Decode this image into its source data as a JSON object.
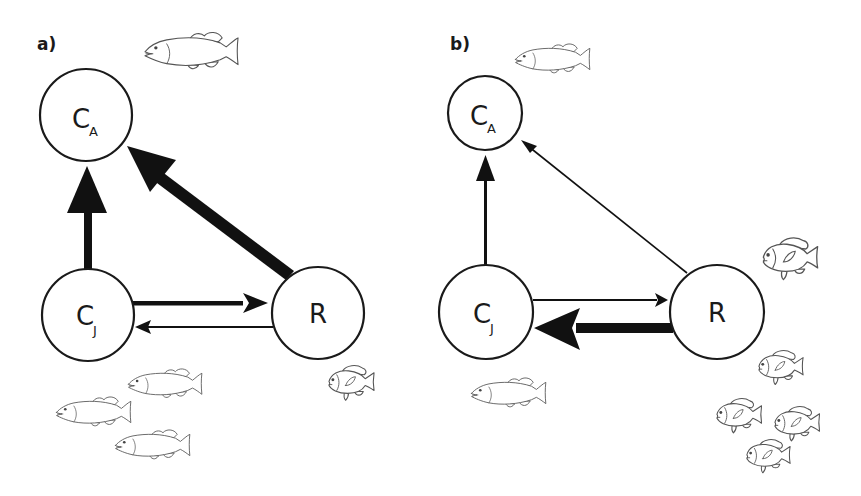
{
  "panels": [
    {
      "label": "a)",
      "nodes": [
        {
          "id": "CA",
          "main": "C",
          "sub": "A"
        },
        {
          "id": "CJ",
          "main": "C",
          "sub": "J"
        },
        {
          "id": "R",
          "main": "R",
          "sub": ""
        }
      ],
      "edges": [
        {
          "from": "CJ",
          "to": "CA",
          "weight": "thick"
        },
        {
          "from": "R",
          "to": "CA",
          "weight": "thick"
        },
        {
          "from": "CJ",
          "to": "R",
          "weight": "medium"
        },
        {
          "from": "R",
          "to": "CJ",
          "weight": "thin"
        }
      ],
      "fish": {
        "bass": 4,
        "sunfish": 1
      }
    },
    {
      "label": "b)",
      "nodes": [
        {
          "id": "CA",
          "main": "C",
          "sub": "A"
        },
        {
          "id": "CJ",
          "main": "C",
          "sub": "J"
        },
        {
          "id": "R",
          "main": "R",
          "sub": ""
        }
      ],
      "edges": [
        {
          "from": "CJ",
          "to": "CA",
          "weight": "medium"
        },
        {
          "from": "R",
          "to": "CA",
          "weight": "thin"
        },
        {
          "from": "CJ",
          "to": "R",
          "weight": "thin"
        },
        {
          "from": "R",
          "to": "CJ",
          "weight": "thick"
        }
      ],
      "fish": {
        "bass": 2,
        "sunfish": 5
      }
    }
  ],
  "icons": {
    "bass": "largemouth-bass-outline",
    "sunfish": "sunfish-outline"
  },
  "colors": {
    "ink": "#1a1a1a",
    "fish_outline": "#555555",
    "background": "#ffffff"
  }
}
